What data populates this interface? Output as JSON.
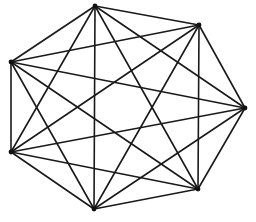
{
  "diagram": {
    "type": "complete-graph",
    "name": "K7",
    "vertex_count": 7,
    "edge_count": 21,
    "colors": {
      "edge": "#1a1a1a",
      "vertex": "#111111",
      "background": "#ffffff"
    },
    "vertices": [
      {
        "id": "v0",
        "x": 95,
        "y": 6
      },
      {
        "id": "v1",
        "x": 199,
        "y": 25
      },
      {
        "id": "v2",
        "x": 245,
        "y": 108
      },
      {
        "id": "v3",
        "x": 198,
        "y": 189
      },
      {
        "id": "v4",
        "x": 94,
        "y": 209
      },
      {
        "id": "v5",
        "x": 11,
        "y": 152
      },
      {
        "id": "v6",
        "x": 11,
        "y": 62
      }
    ]
  }
}
